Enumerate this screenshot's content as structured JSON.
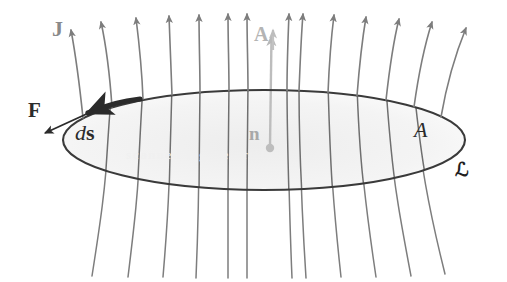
{
  "figure": {
    "background_color": "#ffffff",
    "width": 507,
    "height": 282
  },
  "colors": {
    "field_line": "#7d7d7d",
    "ellipse_stroke": "#3a3a3a",
    "ellipse_fill": "#f2f2f2",
    "force_arrow": "#2b2b2b",
    "ds_arrow": "#2b2b2b",
    "normal_arrow": "#b0b0b0",
    "label_gray": "#8a8a8a",
    "label_black": "#2b2b2b"
  },
  "labels": {
    "current_density": "J",
    "force": "F",
    "line_element": "d",
    "line_element_vector": "s",
    "area_vector": "A",
    "normal_unit_vector": "n",
    "area_scalar": "A",
    "contour": "ℒ"
  },
  "elements": {
    "surface_name": "open surface A",
    "boundary_name": "closed contour",
    "field_name": "current density field lines J",
    "field_line_count": 14,
    "field_direction": "upward"
  },
  "watermark": {
    "text": "scanned figure artifact"
  },
  "geometry": {
    "ellipse_center_x": 264,
    "ellipse_center_y": 140,
    "ellipse_rx": 201,
    "ellipse_ry": 50,
    "normal_base_x": 270,
    "normal_base_y": 148,
    "normal_tip_y": 33
  }
}
